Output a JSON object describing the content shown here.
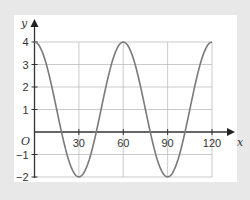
{
  "chart_data": {
    "type": "line",
    "title": "",
    "xlabel": "x",
    "ylabel": "y",
    "origin_label": "O",
    "xlim": [
      0,
      120
    ],
    "ylim": [
      -2,
      4
    ],
    "grid": true,
    "xticks": [
      30,
      60,
      90,
      120
    ],
    "yticks": [
      -2,
      -1,
      1,
      2,
      3,
      4
    ],
    "series": [
      {
        "name": "y = 1 + 3cos(6x)",
        "color": "#7a7a7a",
        "x": [
          0,
          15,
          30,
          45,
          60,
          75,
          90,
          105,
          120
        ],
        "y": [
          4,
          1,
          -2,
          1,
          4,
          1,
          -2,
          1,
          4
        ]
      }
    ]
  },
  "colors": {
    "background": "#e8e8e8",
    "panel": "#ffffff",
    "grid": "#bdbdbd",
    "axis": "#333333",
    "curve": "#7a7a7a"
  }
}
